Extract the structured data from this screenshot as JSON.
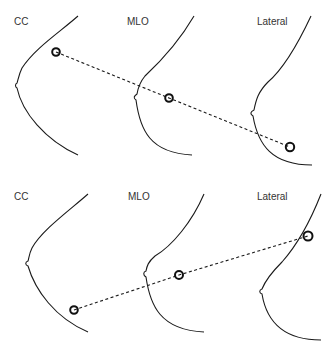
{
  "panels": [
    {
      "id": "top",
      "description": "Lesion located along a line across views (upper set)",
      "views": [
        {
          "label": "CC",
          "label_pos": [
            14,
            25
          ]
        },
        {
          "label": "MLO",
          "label_pos": [
            127,
            25
          ]
        },
        {
          "label": "Lateral",
          "label_pos": [
            257,
            25
          ]
        }
      ],
      "lesions": [
        [
          56,
          52
        ],
        [
          169,
          98
        ],
        [
          290,
          147
        ]
      ]
    },
    {
      "id": "bottom",
      "description": "Lesion located along a line across views (lower set)",
      "views": [
        {
          "label": "CC",
          "label_pos": [
            14,
            200
          ]
        },
        {
          "label": "MLO",
          "label_pos": [
            128,
            200
          ]
        },
        {
          "label": "Lateral",
          "label_pos": [
            257,
            200
          ]
        }
      ],
      "lesions": [
        [
          74,
          310
        ],
        [
          179,
          275
        ],
        [
          308,
          236
        ]
      ]
    }
  ],
  "colors": {
    "line": "#1a1a1a",
    "text": "#333333",
    "background": "#ffffff"
  }
}
